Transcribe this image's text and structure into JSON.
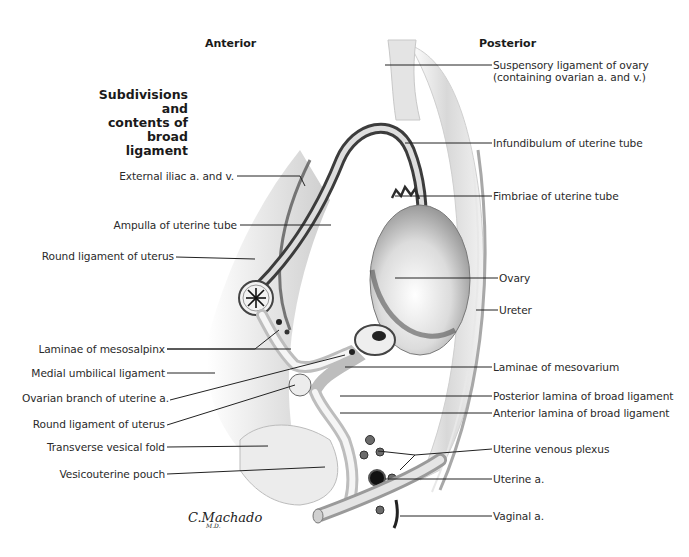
{
  "diagram": {
    "title_lines": [
      "Subdivisions and",
      "contents of",
      "broad ligament"
    ],
    "orientation": {
      "anterior": "Anterior",
      "posterior": "Posterior"
    },
    "signature": {
      "name": "C.Machado",
      "suffix": "M.D."
    },
    "left_labels": [
      "External iliac a. and v.",
      "Ampulla of uterine tube",
      "Round ligament of uterus",
      "Laminae of mesosalpinx",
      "Medial umbilical ligament",
      "Ovarian branch of uterine a.",
      "Round ligament of uterus",
      "Transverse vesical fold",
      "Vesicouterine pouch"
    ],
    "right_labels": [
      "Suspensory ligament of ovary",
      "(containing ovarian a. and v.)",
      "Infundibulum of uterine tube",
      "Fimbriae of uterine tube",
      "Ovary",
      "Ureter",
      "Laminae of mesovarium",
      "Posterior lamina of broad ligament",
      "Anterior lamina of broad ligament",
      "Uterine venous plexus",
      "Uterine a.",
      "Vaginal a."
    ],
    "colors": {
      "ink": "#2a2a2a",
      "tissue_light": "#e6e6e6",
      "tissue_mid": "#bdbdbd",
      "tissue_dark": "#3c3c3c"
    }
  }
}
